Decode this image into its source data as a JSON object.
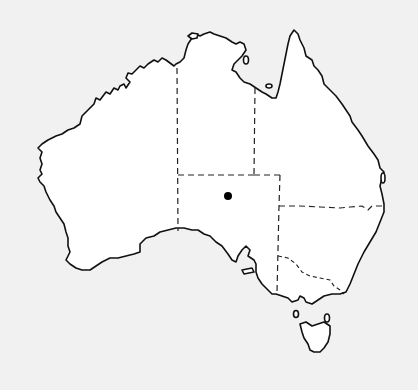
{
  "map": {
    "subject": "Australia outline map with state/territory borders",
    "background_color": "#f1f1f1",
    "land_color": "#ffffff",
    "outline_color": "#111111",
    "border_style": "dashed",
    "marker": {
      "type": "dot",
      "color": "#000000",
      "x": 228,
      "y": 196,
      "radius": 4
    },
    "regions": [
      "western-australia",
      "northern-territory",
      "queensland",
      "south-australia",
      "new-south-wales",
      "victoria",
      "tasmania"
    ]
  }
}
